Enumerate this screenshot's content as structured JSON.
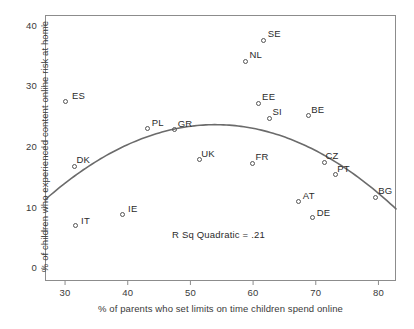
{
  "chart_data": {
    "type": "scatter",
    "title": "",
    "xlabel": "% of parents who set limits on time children spend online",
    "ylabel": "% of children who experienced content online risk at home",
    "xlim": [
      26.8,
      82.8
    ],
    "ylim": [
      -2.1,
      41.8
    ],
    "xticks": [
      30,
      40,
      50,
      60,
      70,
      80
    ],
    "yticks": [
      0,
      10,
      20,
      30,
      40
    ],
    "xtick_labels": [
      "30",
      "40",
      "50",
      "60",
      "70",
      "80"
    ],
    "ytick_labels": [
      "0",
      "10",
      "20",
      "30",
      "40"
    ],
    "grid": false,
    "legend": false,
    "annotation": "R Sq Quadratic = .21",
    "points": [
      {
        "label": "ES",
        "x": 30.0,
        "y": 27.6,
        "label_dx": 7,
        "label_dy": -11
      },
      {
        "label": "DK",
        "x": 31.5,
        "y": 16.8,
        "label_dx": 2,
        "label_dy": -12
      },
      {
        "label": "IT",
        "x": 31.6,
        "y": 7.0,
        "label_dx": 6,
        "label_dy": -11
      },
      {
        "label": "IE",
        "x": 39.1,
        "y": 8.9,
        "label_dx": 6,
        "label_dy": -11
      },
      {
        "label": "PL",
        "x": 43.2,
        "y": 23.0,
        "label_dx": 4,
        "label_dy": -12
      },
      {
        "label": "GR",
        "x": 47.5,
        "y": 22.9,
        "label_dx": 3,
        "label_dy": -12
      },
      {
        "label": "UK",
        "x": 51.4,
        "y": 17.9,
        "label_dx": 2,
        "label_dy": -12
      },
      {
        "label": "NL",
        "x": 58.8,
        "y": 34.2,
        "label_dx": 4,
        "label_dy": -12
      },
      {
        "label": "EE",
        "x": 60.8,
        "y": 27.2,
        "label_dx": 4,
        "label_dy": -12
      },
      {
        "label": "SE",
        "x": 61.7,
        "y": 37.6,
        "label_dx": 4,
        "label_dy": -12
      },
      {
        "label": "FR",
        "x": 59.9,
        "y": 17.3,
        "label_dx": 3,
        "label_dy": -12
      },
      {
        "label": "SI",
        "x": 62.6,
        "y": 24.8,
        "label_dx": 3,
        "label_dy": -12
      },
      {
        "label": "BE",
        "x": 68.8,
        "y": 25.2,
        "label_dx": 3,
        "label_dy": -12
      },
      {
        "label": "AT",
        "x": 67.3,
        "y": 11.1,
        "label_dx": 4,
        "label_dy": -11
      },
      {
        "label": "DE",
        "x": 69.5,
        "y": 8.3,
        "label_dx": 4,
        "label_dy": -11
      },
      {
        "label": "CZ",
        "x": 71.4,
        "y": 17.5,
        "label_dx": 1,
        "label_dy": -12
      },
      {
        "label": "PT",
        "x": 73.1,
        "y": 15.4,
        "label_dx": 2,
        "label_dy": -12
      },
      {
        "label": "BG",
        "x": 79.5,
        "y": 11.7,
        "label_dx": 3,
        "label_dy": -12
      }
    ],
    "fit_curve": {
      "model": "quadratic",
      "r_squared": 0.21,
      "vertex_x": 54.0,
      "vertex_y": 23.7,
      "x_start": 26.8,
      "y_start": 11.3,
      "x_end": 82.8,
      "y_end": 7.1
    },
    "colors": {
      "frame": "#8c8c8c",
      "point_stroke": "#555555",
      "curve": "#6b6b6b",
      "text": "#2b2b2b"
    }
  }
}
